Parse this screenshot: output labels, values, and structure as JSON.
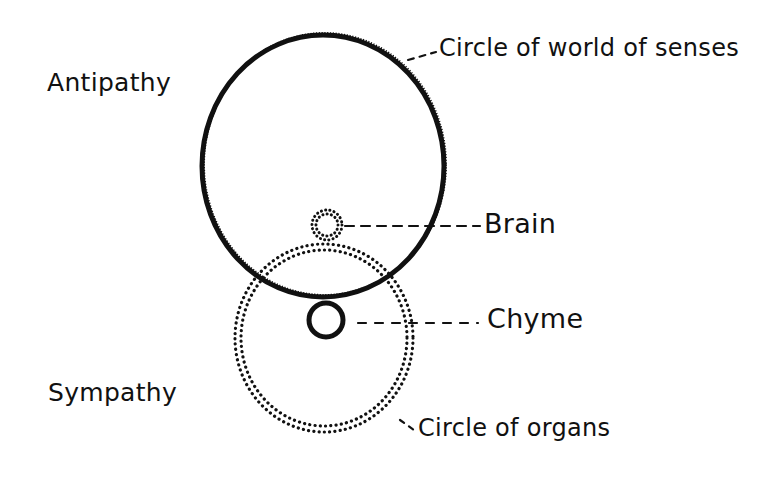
{
  "diagram": {
    "side_labels": {
      "top_left": "Antipathy",
      "bottom_left": "Sympathy"
    },
    "callouts": [
      {
        "id": "senses",
        "label": "Circle of world of senses",
        "target": "large solid circle"
      },
      {
        "id": "brain",
        "label": "Brain",
        "target": "small dotted circle at top of overlap"
      },
      {
        "id": "chyme",
        "label": "Chyme",
        "target": "small solid circle at bottom of overlap"
      },
      {
        "id": "organs",
        "label": "Circle of organs",
        "target": "large dotted circle"
      }
    ],
    "shapes": {
      "senses_circle": {
        "style": "solid hatched",
        "cx": 323,
        "cy": 166,
        "rx": 121,
        "ry": 131
      },
      "organs_circle": {
        "style": "double-dotted",
        "cx": 324,
        "cy": 338,
        "rx": 87,
        "ry": 92
      },
      "brain_circle": {
        "style": "double-dotted",
        "cx": 327,
        "cy": 225,
        "r": 14
      },
      "chyme_circle": {
        "style": "solid",
        "cx": 326,
        "cy": 319,
        "r": 17
      }
    },
    "colors": {
      "ink": "#111111",
      "background": "#ffffff"
    }
  }
}
